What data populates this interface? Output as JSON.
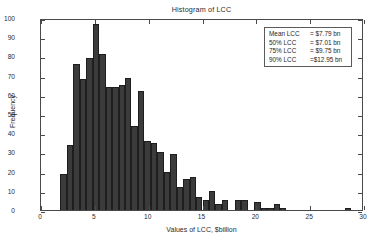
{
  "chart_data": {
    "type": "bar",
    "title": "Histogram of LCC",
    "xlabel": "Values of LCC, $billion",
    "ylabel": "Frequency",
    "xlim": [
      0,
      30
    ],
    "ylim": [
      0,
      100
    ],
    "xticks": [
      0,
      5,
      10,
      15,
      20,
      25,
      30
    ],
    "yticks": [
      0,
      10,
      20,
      30,
      40,
      50,
      60,
      70,
      80,
      90,
      100
    ],
    "grid": false,
    "legend_position": "top-right",
    "bar_color": "#3b3b3b",
    "bin_width": 0.6,
    "bin_starts": [
      1.8,
      2.4,
      3.0,
      3.6,
      4.2,
      4.8,
      5.4,
      6.0,
      6.6,
      7.2,
      7.8,
      8.4,
      9.0,
      9.6,
      10.2,
      10.8,
      11.4,
      12.0,
      12.6,
      13.2,
      13.8,
      14.4,
      15.0,
      15.6,
      16.2,
      16.8,
      17.4,
      18.0,
      18.6,
      19.2,
      19.8,
      20.4,
      21.0,
      21.6,
      22.2,
      22.8,
      23.4,
      28.2
    ],
    "values": [
      19,
      34,
      76,
      68,
      79,
      97,
      81,
      64,
      64,
      65,
      69,
      44,
      62,
      36,
      35,
      30,
      20,
      29,
      12,
      16,
      17,
      7,
      5,
      10,
      3,
      5,
      0,
      5,
      5,
      0,
      4,
      1,
      1,
      3,
      1,
      0,
      0,
      1
    ],
    "categories": [
      "1.8",
      "2.4",
      "3.0",
      "3.6",
      "4.2",
      "4.8",
      "5.4",
      "6.0",
      "6.6",
      "7.2",
      "7.8",
      "8.4",
      "9.0",
      "9.6",
      "10.2",
      "10.8",
      "11.4",
      "12.0",
      "12.6",
      "13.2",
      "13.8",
      "14.4",
      "15.0",
      "15.6",
      "16.2",
      "16.8",
      "17.4",
      "18.0",
      "18.6",
      "19.2",
      "19.8",
      "20.4",
      "21.0",
      "21.6",
      "22.2",
      "22.8",
      "23.4",
      "28.2"
    ],
    "annotations": [
      {
        "label": "Mean LCC",
        "value": "= $7.79 bn"
      },
      {
        "label": "50% LCC",
        "value": "= $7.01 bn"
      },
      {
        "label": "75% LCC",
        "value": "= $9.75 bn"
      },
      {
        "label": "90% LCC",
        "value": "=$12.95 bn"
      }
    ]
  }
}
